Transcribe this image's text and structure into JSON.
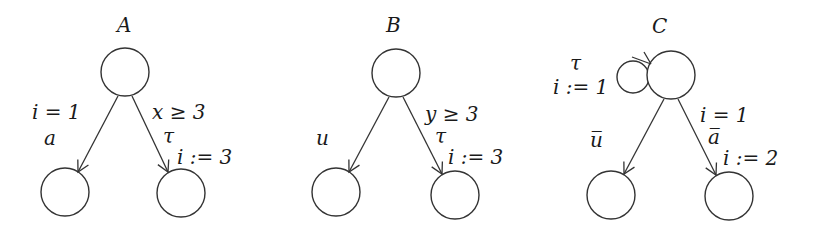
{
  "diagram": {
    "type": "automata",
    "automata": [
      {
        "name": "A",
        "edges": [
          {
            "from": "top",
            "to": "left",
            "guard": "i = 1",
            "action": "a",
            "update": ""
          },
          {
            "from": "top",
            "to": "right",
            "guard": "x ≥ 3",
            "action": "τ",
            "update": "i := 3"
          }
        ]
      },
      {
        "name": "B",
        "edges": [
          {
            "from": "top",
            "to": "left",
            "guard": "",
            "action": "u",
            "update": ""
          },
          {
            "from": "top",
            "to": "right",
            "guard": "y ≥ 3",
            "action": "τ",
            "update": "i := 3"
          }
        ]
      },
      {
        "name": "C",
        "self_loop": {
          "action": "τ",
          "update": "i := 1"
        },
        "edges": [
          {
            "from": "top",
            "to": "left",
            "guard": "",
            "action": "u̅",
            "update": ""
          },
          {
            "from": "top",
            "to": "right",
            "guard": "i = 1",
            "action": "a̅",
            "update": "i := 2"
          }
        ]
      }
    ]
  }
}
